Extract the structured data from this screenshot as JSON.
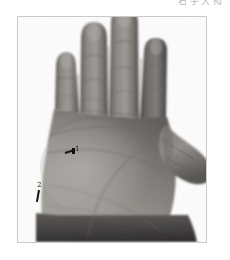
{
  "page": {
    "background_color": "#ffffff",
    "width": 230,
    "height": 260
  },
  "caption": {
    "text": "右手大拇",
    "color": "#b9b9b9",
    "note": "faint CJK characters clipped by the top edge"
  },
  "figure": {
    "frame": {
      "border_color": "#c9c9c9",
      "background_color": "#ffffff"
    },
    "photo": {
      "subject": "human hand, palm facing viewer",
      "orientation": "four fingers extending upward, thumb extending to the right",
      "color_mode": "grayscale",
      "skin_light": "#b0aca8",
      "skin_mid": "#8c8884",
      "skin_dark": "#5f5c59",
      "skin_shadow": "#3a3836",
      "backdrop": "#fdfdfd"
    },
    "annotations": [
      {
        "id": "1",
        "label": "1",
        "target": "mid palm"
      },
      {
        "id": "2",
        "label": "2",
        "target": "lower-left palm near thenar"
      }
    ]
  }
}
